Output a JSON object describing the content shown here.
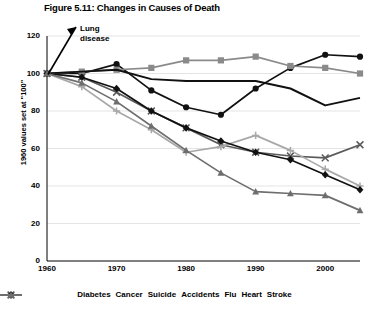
{
  "title": "Figure 5.11: Changes in Causes of Death",
  "annotation": {
    "line1": "Lung",
    "line2": "disease"
  },
  "axis": {
    "ylabel": "1960 values set at \"100\"",
    "yticks": [
      "0",
      "20",
      "40",
      "60",
      "80",
      "100",
      "120"
    ],
    "xticks": [
      "1960",
      "1970",
      "1980",
      "1990",
      "2000"
    ]
  },
  "legend": [
    {
      "label": "Diabetes",
      "marker": "circle",
      "color": "#111111"
    },
    {
      "label": "Cancer",
      "marker": "square",
      "color": "#8a8a8a"
    },
    {
      "label": "Suicide",
      "marker": "none",
      "color": "#111111"
    },
    {
      "label": "Accidents",
      "marker": "x",
      "color": "#5a5a5a"
    },
    {
      "label": "Flu",
      "marker": "plus",
      "color": "#a8a8a8"
    },
    {
      "label": "Heart",
      "marker": "diamond",
      "color": "#111111"
    },
    {
      "label": "Stroke",
      "marker": "triangle",
      "color": "#6e6e6e"
    }
  ],
  "chart_data": {
    "type": "line",
    "title": "Figure 5.11: Changes in Causes of Death",
    "xlabel": "",
    "ylabel": "1960 values set at \"100\"",
    "xlim": [
      1960,
      2005
    ],
    "ylim": [
      0,
      120
    ],
    "grid": true,
    "legend_position": "bottom",
    "annotations": [
      {
        "text": "Lung disease",
        "points_to_year": 1960,
        "points_to_value": 100
      }
    ],
    "x": [
      1960,
      1965,
      1970,
      1975,
      1980,
      1985,
      1990,
      1995,
      2000,
      2005
    ],
    "series": [
      {
        "name": "Diabetes",
        "marker": "circle",
        "color": "#111111",
        "values": [
          100,
          100,
          105,
          91,
          82,
          78,
          92,
          103,
          110,
          109
        ]
      },
      {
        "name": "Cancer",
        "marker": "square",
        "color": "#8a8a8a",
        "values": [
          100,
          101,
          102,
          103,
          107,
          107,
          109,
          104,
          103,
          100
        ]
      },
      {
        "name": "Suicide",
        "marker": "none",
        "color": "#111111",
        "values": [
          100,
          101,
          102,
          97,
          96,
          96,
          96,
          92,
          83,
          87
        ]
      },
      {
        "name": "Accidents",
        "marker": "x",
        "color": "#5a5a5a",
        "values": [
          100,
          98,
          90,
          80,
          71,
          62,
          58,
          56,
          55,
          62
        ]
      },
      {
        "name": "Flu",
        "marker": "plus",
        "color": "#a8a8a8",
        "values": [
          100,
          93,
          80,
          70,
          58,
          61,
          67,
          59,
          49,
          40
        ]
      },
      {
        "name": "Heart",
        "marker": "diamond",
        "color": "#111111",
        "values": [
          100,
          98,
          92,
          80,
          71,
          64,
          58,
          54,
          46,
          38
        ]
      },
      {
        "name": "Stroke",
        "marker": "triangle",
        "color": "#6e6e6e",
        "values": [
          100,
          95,
          85,
          72,
          59,
          47,
          37,
          36,
          35,
          27
        ]
      }
    ]
  }
}
